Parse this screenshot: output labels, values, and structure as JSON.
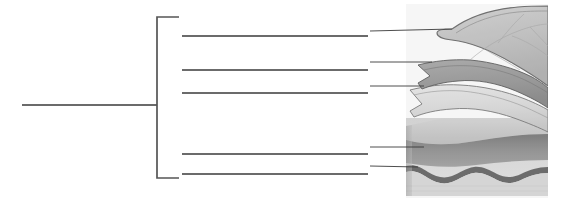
{
  "figure": {
    "kind": "anatomical-illustration",
    "width": 562,
    "height": 206,
    "background_color": "#ffffff"
  },
  "colors": {
    "line": "#3a3a3a",
    "bracket": "#555555",
    "background": "#ffffff",
    "layer_top_fill": "#c9c9c9",
    "layer_top_edge": "#6f6f6f",
    "layer_second_fill": "#a0a0a0",
    "layer_second_edge": "#5e5e5e",
    "layer_third_fill": "#dedede",
    "layer_third_edge": "#7a7a7a",
    "block_upper_fill": "#cfcfcf",
    "block_mid_fill": "#8f8f8f",
    "block_lower_fill": "#d6d6d6",
    "wavy_band": "#6b6b6b",
    "vessel_line": "#b0b0b0"
  },
  "stem": {
    "name": "main-leader-line",
    "x1": 22,
    "y1": 105,
    "x2": 157,
    "y2": 105,
    "label_text": ""
  },
  "bracket": {
    "name": "grouping-bracket",
    "x": 157,
    "top_y": 17,
    "bottom_y": 178,
    "arm_length": 22,
    "orientation": "opens-right"
  },
  "leader_lines": [
    {
      "id": "leader-1",
      "label_text": "",
      "line": {
        "x1": 182,
        "y1": 36,
        "x2": 368,
        "y2": 36
      },
      "pointer": {
        "x1": 370,
        "y1": 31,
        "x2": 452,
        "y2": 29
      },
      "target": "outermost-layer"
    },
    {
      "id": "leader-2",
      "label_text": "",
      "line": {
        "x1": 182,
        "y1": 70,
        "x2": 368,
        "y2": 70
      },
      "pointer": {
        "x1": 370,
        "y1": 62,
        "x2": 432,
        "y2": 62
      },
      "target": "second-layer"
    },
    {
      "id": "leader-3",
      "label_text": "",
      "line": {
        "x1": 182,
        "y1": 93,
        "x2": 368,
        "y2": 93
      },
      "pointer": {
        "x1": 370,
        "y1": 86,
        "x2": 424,
        "y2": 86
      },
      "target": "third-layer"
    },
    {
      "id": "leader-4",
      "label_text": "",
      "line": {
        "x1": 182,
        "y1": 154,
        "x2": 368,
        "y2": 154
      },
      "pointer": {
        "x1": 370,
        "y1": 147,
        "x2": 424,
        "y2": 147
      },
      "target": "block-middle-band"
    },
    {
      "id": "leader-5",
      "label_text": "",
      "line": {
        "x1": 182,
        "y1": 174,
        "x2": 368,
        "y2": 174
      },
      "pointer": {
        "x1": 370,
        "y1": 166,
        "x2": 418,
        "y2": 167
      },
      "target": "wavy-dark-band"
    }
  ],
  "illustration": {
    "name": "layered-tissue-illustration",
    "bounds": {
      "x": 406,
      "y": 4,
      "width": 142,
      "height": 194
    },
    "layers": [
      {
        "id": "outermost-layer",
        "description": "large rounded light-gray dome with faint branching vessel lines"
      },
      {
        "id": "second-layer",
        "description": "medium-gray sheet with pointed left tip"
      },
      {
        "id": "third-layer",
        "description": "pale sheet with thin dark outline and pointed left tip"
      },
      {
        "id": "block-upper-band",
        "description": "light band at top of rectangular cut block"
      },
      {
        "id": "block-middle-band",
        "description": "dark gray band across the rectangular cut block"
      },
      {
        "id": "wavy-dark-band",
        "description": "thick wavy dark line beneath the middle band"
      },
      {
        "id": "block-lower-band",
        "description": "pale base of the rectangular cut block"
      }
    ]
  }
}
